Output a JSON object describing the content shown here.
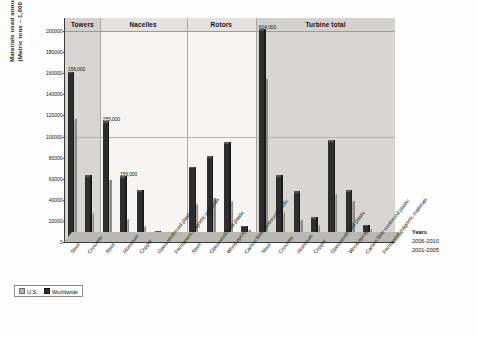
{
  "axis": {
    "y_title_line1": "Materials used annually",
    "y_title_line2": "(Metric tons – 1,000 kg)",
    "y_ticks": [
      "0",
      "20000",
      "40000",
      "60000",
      "80000",
      "100000",
      "120000",
      "140000",
      "160000",
      "180000",
      "200000"
    ],
    "y_min": 0,
    "y_max": 200000
  },
  "legend": {
    "us_label": "U.S.",
    "worldwide_label": "Worldwide"
  },
  "years_legend": {
    "title": "Years",
    "front": "2006-2010",
    "back": "2001-2005"
  },
  "chart_data": {
    "type": "bar",
    "title": "",
    "xlabel": "",
    "ylabel": "Materials used annually (Metric tons – 1,000 kg)",
    "ylim": [
      0,
      200000
    ],
    "grid": true,
    "legend_position": "bottom-left",
    "group_headers": [
      "Towers",
      "Nacelles",
      "Rotors",
      "Turbine total"
    ],
    "series": [
      {
        "name": "U.S.",
        "color": "#a9a8a6"
      },
      {
        "name": "Worldwide",
        "color": "#2e2e2e"
      }
    ],
    "groups": [
      {
        "name": "Towers",
        "categories": [
          "Steel",
          "Concrete"
        ],
        "us": [
          110000,
          21000
        ],
        "worldwide": [
          160000,
          62000
        ],
        "labels": [
          {
            "category": "Steel",
            "text": "156,000",
            "series": "Worldwide"
          },
          {
            "category": "Steel",
            "text": "407,000",
            "series": "U.S."
          }
        ]
      },
      {
        "name": "Nacelles",
        "categories": [
          "Steel",
          "Aluminum",
          "Copper",
          "Glass reinforced plastic",
          "Permanent magnetic materials"
        ],
        "us": [
          53000,
          16000,
          9000,
          3000,
          1000
        ],
        "worldwide": [
          113000,
          61000,
          48000,
          9000,
          3000
        ],
        "labels": [
          {
            "category": "Steel",
            "text": "255,000",
            "series": "Worldwide"
          },
          {
            "category": "Aluminum",
            "text": "159,000",
            "series": "Worldwide"
          }
        ]
      },
      {
        "name": "Rotors",
        "categories": [
          "Steel",
          "Glass reinforced plastic",
          "Wood epoxy",
          "Carbon fiber reinforced plastic"
        ],
        "us": [
          30000,
          35000,
          33000,
          5000
        ],
        "worldwide": [
          70000,
          80000,
          93000,
          14000
        ],
        "labels": []
      },
      {
        "name": "Turbine total",
        "categories": [
          "Steel",
          "Concrete",
          "Aluminum",
          "Copper",
          "Glass reinforced plastic",
          "Wood epoxy",
          "Carbon fiber reinforced plastic",
          "Permanent magnetic materials"
        ],
        "us": [
          148000,
          22000,
          15000,
          10000,
          39000,
          33000,
          6000,
          2000
        ],
        "worldwide": [
          200000,
          62000,
          47000,
          22000,
          95000,
          48000,
          15000,
          4000
        ],
        "labels": [
          {
            "category": "Steel",
            "text": "604,000",
            "series": "Worldwide"
          }
        ]
      }
    ]
  }
}
